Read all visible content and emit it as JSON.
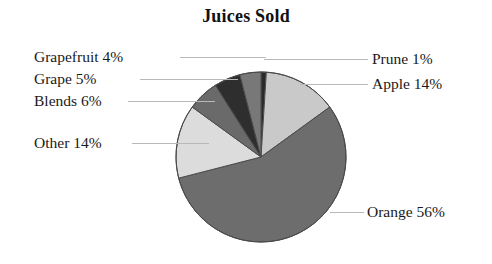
{
  "chart_data": {
    "type": "pie",
    "title": "Juices Sold",
    "xlabel": "",
    "ylabel": "",
    "legend_position": "none",
    "grid": false,
    "units": "percent",
    "total": 100,
    "start_angle_deg": 0,
    "direction": "clockwise",
    "categories": [
      "Prune",
      "Apple",
      "Orange",
      "Other",
      "Blends",
      "Grape",
      "Grapefruit"
    ],
    "values": [
      1,
      14,
      56,
      14,
      6,
      5,
      4
    ],
    "slices": [
      {
        "name": "Prune",
        "label": "Prune 1%",
        "value": 1,
        "color": "#2b2b2b",
        "side": "right"
      },
      {
        "name": "Apple",
        "label": "Apple 14%",
        "value": 14,
        "color": "#c9c9c9",
        "side": "right"
      },
      {
        "name": "Orange",
        "label": "Orange 56%",
        "value": 56,
        "color": "#6d6d6d",
        "side": "right"
      },
      {
        "name": "Other",
        "label": "Other 14%",
        "value": 14,
        "color": "#dcdcdc",
        "side": "left"
      },
      {
        "name": "Blends",
        "label": "Blends 6%",
        "value": 6,
        "color": "#6a6a6a",
        "side": "left"
      },
      {
        "name": "Grape",
        "label": "Grape 5%",
        "value": 5,
        "color": "#2e2e2e",
        "side": "left"
      },
      {
        "name": "Grapefruit",
        "label": "Grapefruit 4%",
        "value": 4,
        "color": "#787878",
        "side": "left"
      }
    ],
    "style": {
      "background": "#ffffff",
      "text_color": "#1a1a1a",
      "leader_line_color": "#b9b9b9",
      "slice_outline_color": "#4a4a4a",
      "center_x": 261,
      "center_y": 157,
      "radius": 85
    }
  }
}
